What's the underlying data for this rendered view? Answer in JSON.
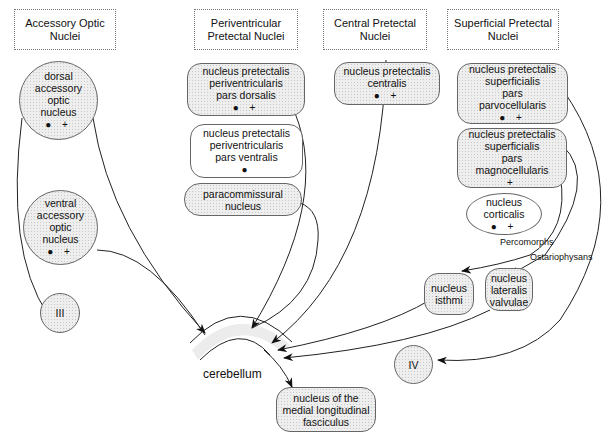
{
  "headers": [
    {
      "id": "accessory",
      "lines": [
        "Accessory Optic",
        "Nuclei"
      ]
    },
    {
      "id": "periventricular",
      "lines": [
        "Periventricular",
        "Pretectal Nuclei"
      ]
    },
    {
      "id": "central",
      "lines": [
        "Central Pretectal",
        "Nuclei"
      ]
    },
    {
      "id": "superficial",
      "lines": [
        "Superficial Pretectal",
        "Nuclei"
      ]
    }
  ],
  "nodes": {
    "dorsal_aon": {
      "lines": [
        "dorsal",
        "accessory",
        "optic",
        "nucleus"
      ],
      "marks": "● +"
    },
    "ventral_aon": {
      "lines": [
        "ventral",
        "accessory",
        "optic",
        "nucleus"
      ],
      "marks": "● +"
    },
    "III": {
      "lines": [
        "III"
      ]
    },
    "nppd": {
      "lines": [
        "nucleus pretectalis",
        "periventricularis",
        "pars dorsalis"
      ],
      "marks": "● +"
    },
    "nppv": {
      "lines": [
        "nucleus pretectalis",
        "periventricularis",
        "pars ventralis"
      ],
      "marks": "●"
    },
    "paracommissural": {
      "lines": [
        "paracommissural",
        "nucleus"
      ]
    },
    "npc": {
      "lines": [
        "nucleus pretectalis",
        "centralis"
      ],
      "marks": "● +"
    },
    "npsp": {
      "lines": [
        "nucleus pretectalis",
        "superficialis",
        "pars",
        "parvocellularis"
      ],
      "marks": "● +"
    },
    "npsm": {
      "lines": [
        "nucleus pretectalis",
        "superficialis",
        "pars",
        "magnocellularis"
      ],
      "marks": "+"
    },
    "corticalis": {
      "lines": [
        "nucleus",
        "corticalis"
      ],
      "marks": "● +"
    },
    "isthmi": {
      "lines": [
        "nucleus",
        "isthmi"
      ]
    },
    "nlv": {
      "lines": [
        "nucleus",
        "lateralis",
        "valvulae"
      ]
    },
    "IV": {
      "lines": [
        "IV"
      ]
    },
    "cerebellum": {
      "label": "cerebellum"
    },
    "nmlf": {
      "lines": [
        "nucleus of the",
        "medial longitudinal",
        "fasciculus"
      ]
    }
  },
  "edge_labels": {
    "percomorphs": "Percomorphs",
    "ostariophysans": "Ostariophysans"
  },
  "legend_marks": {
    "dot": "●",
    "plus": "+"
  }
}
